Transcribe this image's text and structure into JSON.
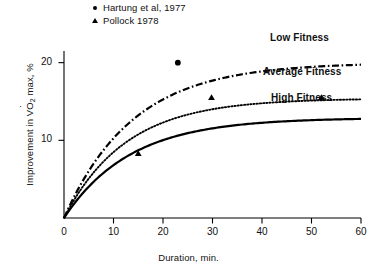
{
  "figure": {
    "background": "#ffffff",
    "ink": "#000000"
  },
  "legend": {
    "entries": [
      {
        "marker": "circle-marker",
        "label": "Hartung et al, 1977"
      },
      {
        "marker": "triangle-marker",
        "label": "Pollock 1978"
      }
    ]
  },
  "curve_labels": {
    "low": "Low Fitness",
    "average": "Average Fitness",
    "high": "High Fitness"
  },
  "axes": {
    "x_title": "Duration, min.",
    "y_title_prefix": "Improvement in V",
    "y_title_sub": "2",
    "y_title_suffix": " max, %",
    "x_ticks": [
      "0",
      "10",
      "20",
      "30",
      "40",
      "50",
      "60"
    ],
    "y_ticks": [
      "10",
      "20"
    ]
  },
  "chart_data": {
    "type": "line",
    "title": "",
    "xlabel": "Duration, min.",
    "ylabel": "Improvement in VO2 max, %",
    "xlim": [
      0,
      60
    ],
    "ylim": [
      0,
      21.5
    ],
    "xticks": [
      0,
      10,
      20,
      30,
      40,
      50,
      60
    ],
    "yticks": [
      0,
      10,
      20
    ],
    "grid": false,
    "legend_position": "top-center",
    "series": [
      {
        "name": "Low Fitness",
        "style": "dash-dot",
        "plateau": 20.0,
        "rate": 0.072,
        "label_position": "right-top",
        "x": [
          0,
          2,
          4,
          6,
          8,
          10,
          15,
          20,
          25,
          30,
          35,
          40,
          45,
          50,
          55,
          60
        ],
        "y": [
          0.0,
          3.5,
          6.0,
          8.1,
          9.9,
          11.3,
          13.9,
          15.6,
          16.8,
          17.7,
          18.4,
          18.9,
          19.2,
          19.5,
          19.7,
          20.0
        ]
      },
      {
        "name": "Average Fitness",
        "style": "dotted",
        "plateau": 15.4,
        "rate": 0.08,
        "label_position": "right-middle",
        "x": [
          0,
          2,
          4,
          6,
          8,
          10,
          15,
          20,
          25,
          30,
          35,
          40,
          45,
          50,
          55,
          60
        ],
        "y": [
          0.0,
          3.0,
          5.1,
          6.8,
          8.2,
          9.4,
          11.4,
          12.6,
          13.4,
          14.0,
          14.5,
          14.8,
          15.0,
          15.2,
          15.3,
          15.4
        ]
      },
      {
        "name": "High Fitness",
        "style": "solid",
        "plateau": 12.9,
        "rate": 0.075,
        "label_position": "right-bottom",
        "x": [
          0,
          2,
          4,
          6,
          8,
          10,
          15,
          20,
          25,
          30,
          35,
          40,
          45,
          50,
          55,
          60
        ],
        "y": [
          0.0,
          2.4,
          4.2,
          5.6,
          6.8,
          7.7,
          9.4,
          10.5,
          11.2,
          11.7,
          12.1,
          12.4,
          12.6,
          12.7,
          12.8,
          12.9
        ]
      }
    ],
    "scatter": [
      {
        "name": "Hartung et al, 1977",
        "marker": "circle",
        "points": [
          {
            "x": 23.0,
            "y": 20.0
          }
        ]
      },
      {
        "name": "Pollock 1978",
        "marker": "triangle",
        "points": [
          {
            "x": 15.0,
            "y": 8.3
          },
          {
            "x": 29.8,
            "y": 15.5
          },
          {
            "x": 52.0,
            "y": 15.5
          }
        ]
      }
    ]
  }
}
